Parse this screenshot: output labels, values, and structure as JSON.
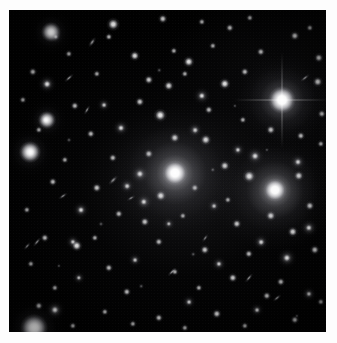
{
  "image": {
    "kind": "astronomical-photograph",
    "subject": "galaxy cluster field",
    "alt_text": "Deep optical image of a rich galaxy cluster: a black sky field densely populated with hundreds of point-like stars and fuzzy elliptical galaxies, dominated by two large diffuse central galaxies and one very bright foreground star near the upper right.",
    "width_px": 337,
    "height_px": 343,
    "plate": {
      "left_px": 9,
      "top_px": 10,
      "width_px": 317,
      "height_px": 322,
      "background_color": "#010101"
    },
    "border": {
      "color": "#fdfdfd",
      "top_px": 10,
      "left_px": 9,
      "right_px": 11,
      "bottom_px": 11
    },
    "palette": {
      "sky": "#010101",
      "faint_glow": "#16161a",
      "star_core": "#ffffff",
      "galaxy_halo": "#c4c4ca",
      "page": "#fdfdfd"
    }
  },
  "chart_data": {
    "type": "scatter",
    "title": "",
    "xlabel": "",
    "ylabel": "",
    "xlim": [
      0,
      317
    ],
    "ylim": [
      0,
      322
    ],
    "grid": false,
    "legend": "none",
    "note": "Positions are plate pixel coordinates relative to the dark field; size is apparent diameter in px; brightness is relative 0-1.",
    "dominant_objects": [
      {
        "name": "central-cd-galaxy",
        "x": 166,
        "y": 163,
        "size": 13,
        "halo": 66,
        "brightness": 1.0,
        "class": "cD elliptical"
      },
      {
        "name": "second-cd-galaxy",
        "x": 266,
        "y": 180,
        "size": 12,
        "halo": 60,
        "brightness": 0.97,
        "class": "cD elliptical"
      },
      {
        "name": "bright-foreground-star",
        "x": 273,
        "y": 90,
        "size": 14,
        "halo": 46,
        "brightness": 1.0,
        "class": "star with diffraction spikes"
      },
      {
        "name": "bottom-left-galaxy",
        "x": 25,
        "y": 318,
        "size": 14,
        "halo": 30,
        "brightness": 0.85,
        "class": "elliptical"
      },
      {
        "name": "left-mid-galaxy",
        "x": 21,
        "y": 142,
        "size": 11,
        "halo": 24,
        "brightness": 0.8,
        "class": "elliptical"
      },
      {
        "name": "upper-left-galaxy",
        "x": 42,
        "y": 22,
        "size": 10,
        "halo": 22,
        "brightness": 0.78,
        "class": "elliptical"
      },
      {
        "name": "left-galaxy-pair",
        "x": 38,
        "y": 110,
        "size": 9,
        "halo": 20,
        "brightness": 0.72,
        "class": "elliptical"
      }
    ],
    "galaxies": [
      {
        "x": 42,
        "y": 22,
        "r": 5.0,
        "b": 0.9,
        "t": "gal"
      },
      {
        "x": 47,
        "y": 27,
        "r": 3.2,
        "b": 0.62,
        "t": "gal"
      },
      {
        "x": 38,
        "y": 74,
        "r": 4.4,
        "b": 0.84,
        "t": "gal"
      },
      {
        "x": 21,
        "y": 142,
        "r": 5.4,
        "b": 0.88,
        "t": "gal"
      },
      {
        "x": 37,
        "y": 110,
        "r": 4.6,
        "b": 0.8,
        "t": "gal"
      },
      {
        "x": 25,
        "y": 318,
        "r": 6.6,
        "b": 0.86,
        "t": "gal"
      },
      {
        "x": 46,
        "y": 300,
        "r": 4.6,
        "b": 0.78,
        "t": "gal"
      },
      {
        "x": 72,
        "y": 200,
        "r": 4.0,
        "b": 0.74,
        "t": "gal"
      },
      {
        "x": 64,
        "y": 232,
        "r": 3.6,
        "b": 0.66,
        "t": "gal"
      },
      {
        "x": 118,
        "y": 176,
        "r": 3.8,
        "b": 0.7,
        "t": "gal"
      },
      {
        "x": 131,
        "y": 164,
        "r": 4.6,
        "b": 0.8,
        "t": "gal"
      },
      {
        "x": 135,
        "y": 192,
        "r": 4.2,
        "b": 0.76,
        "t": "gal"
      },
      {
        "x": 112,
        "y": 118,
        "r": 4.0,
        "b": 0.74,
        "t": "gal"
      },
      {
        "x": 95,
        "y": 95,
        "r": 3.4,
        "b": 0.64,
        "t": "gal"
      },
      {
        "x": 186,
        "y": 120,
        "r": 3.8,
        "b": 0.7,
        "t": "gal"
      },
      {
        "x": 193,
        "y": 86,
        "r": 4.2,
        "b": 0.76,
        "t": "gal"
      },
      {
        "x": 229,
        "y": 140,
        "r": 3.6,
        "b": 0.68,
        "t": "gal"
      },
      {
        "x": 246,
        "y": 146,
        "r": 4.4,
        "b": 0.8,
        "t": "gal"
      },
      {
        "x": 289,
        "y": 152,
        "r": 4.0,
        "b": 0.74,
        "t": "gal"
      },
      {
        "x": 300,
        "y": 218,
        "r": 4.2,
        "b": 0.76,
        "t": "gal"
      },
      {
        "x": 278,
        "y": 248,
        "r": 4.6,
        "b": 0.8,
        "t": "gal"
      },
      {
        "x": 252,
        "y": 232,
        "r": 3.8,
        "b": 0.7,
        "t": "gal"
      },
      {
        "x": 210,
        "y": 254,
        "r": 3.6,
        "b": 0.66,
        "t": "gal"
      },
      {
        "x": 180,
        "y": 292,
        "r": 3.4,
        "b": 0.62,
        "t": "gal"
      },
      {
        "x": 248,
        "y": 300,
        "r": 3.4,
        "b": 0.62,
        "t": "gal"
      },
      {
        "x": 300,
        "y": 284,
        "r": 3.6,
        "b": 0.66,
        "t": "gal"
      },
      {
        "x": 70,
        "y": 268,
        "r": 3.2,
        "b": 0.58,
        "t": "gal"
      },
      {
        "x": 126,
        "y": 250,
        "r": 3.4,
        "b": 0.62,
        "t": "gal"
      },
      {
        "x": 160,
        "y": 214,
        "r": 3.2,
        "b": 0.6,
        "t": "gal"
      },
      {
        "x": 205,
        "y": 196,
        "r": 3.4,
        "b": 0.62,
        "t": "gal"
      }
    ],
    "stars": [
      {
        "x": 104,
        "y": 14,
        "r": 2.6,
        "b": 0.95
      },
      {
        "x": 100,
        "y": 27,
        "r": 1.6,
        "b": 0.7
      },
      {
        "x": 154,
        "y": 9,
        "r": 2.0,
        "b": 0.8
      },
      {
        "x": 193,
        "y": 12,
        "r": 1.6,
        "b": 0.66
      },
      {
        "x": 221,
        "y": 18,
        "r": 1.8,
        "b": 0.72
      },
      {
        "x": 241,
        "y": 8,
        "r": 1.6,
        "b": 0.64
      },
      {
        "x": 286,
        "y": 26,
        "r": 2.0,
        "b": 0.78
      },
      {
        "x": 301,
        "y": 18,
        "r": 1.6,
        "b": 0.64
      },
      {
        "x": 60,
        "y": 44,
        "r": 1.6,
        "b": 0.62
      },
      {
        "x": 126,
        "y": 46,
        "r": 2.2,
        "b": 0.84
      },
      {
        "x": 165,
        "y": 41,
        "r": 1.6,
        "b": 0.64
      },
      {
        "x": 180,
        "y": 52,
        "r": 2.4,
        "b": 0.88
      },
      {
        "x": 204,
        "y": 36,
        "r": 1.6,
        "b": 0.62
      },
      {
        "x": 252,
        "y": 42,
        "r": 1.8,
        "b": 0.7
      },
      {
        "x": 310,
        "y": 48,
        "r": 2.0,
        "b": 0.76
      },
      {
        "x": 24,
        "y": 62,
        "r": 1.8,
        "b": 0.7
      },
      {
        "x": 88,
        "y": 64,
        "r": 1.6,
        "b": 0.62
      },
      {
        "x": 140,
        "y": 70,
        "r": 2.0,
        "b": 0.78
      },
      {
        "x": 160,
        "y": 76,
        "r": 2.2,
        "b": 0.82
      },
      {
        "x": 176,
        "y": 64,
        "r": 1.6,
        "b": 0.64
      },
      {
        "x": 216,
        "y": 74,
        "r": 2.4,
        "b": 0.88
      },
      {
        "x": 236,
        "y": 62,
        "r": 1.8,
        "b": 0.7
      },
      {
        "x": 309,
        "y": 72,
        "r": 2.2,
        "b": 0.82
      },
      {
        "x": 14,
        "y": 90,
        "r": 1.6,
        "b": 0.62
      },
      {
        "x": 66,
        "y": 96,
        "r": 1.8,
        "b": 0.7
      },
      {
        "x": 131,
        "y": 92,
        "r": 2.0,
        "b": 0.76
      },
      {
        "x": 151,
        "y": 105,
        "r": 2.6,
        "b": 0.92
      },
      {
        "x": 200,
        "y": 100,
        "r": 1.8,
        "b": 0.7
      },
      {
        "x": 234,
        "y": 110,
        "r": 1.6,
        "b": 0.64
      },
      {
        "x": 313,
        "y": 104,
        "r": 1.8,
        "b": 0.7
      },
      {
        "x": 30,
        "y": 120,
        "r": 1.6,
        "b": 0.62
      },
      {
        "x": 82,
        "y": 124,
        "r": 1.8,
        "b": 0.7
      },
      {
        "x": 166,
        "y": 128,
        "r": 2.2,
        "b": 0.82
      },
      {
        "x": 197,
        "y": 130,
        "r": 2.4,
        "b": 0.86
      },
      {
        "x": 262,
        "y": 120,
        "r": 2.0,
        "b": 0.76
      },
      {
        "x": 292,
        "y": 126,
        "r": 1.8,
        "b": 0.7
      },
      {
        "x": 312,
        "y": 134,
        "r": 1.6,
        "b": 0.64
      },
      {
        "x": 56,
        "y": 150,
        "r": 1.6,
        "b": 0.62
      },
      {
        "x": 104,
        "y": 148,
        "r": 1.8,
        "b": 0.7
      },
      {
        "x": 140,
        "y": 144,
        "r": 2.0,
        "b": 0.76
      },
      {
        "x": 216,
        "y": 156,
        "r": 2.2,
        "b": 0.82
      },
      {
        "x": 240,
        "y": 166,
        "r": 2.6,
        "b": 0.92
      },
      {
        "x": 290,
        "y": 166,
        "r": 2.2,
        "b": 0.82
      },
      {
        "x": 44,
        "y": 172,
        "r": 1.8,
        "b": 0.7
      },
      {
        "x": 88,
        "y": 178,
        "r": 2.0,
        "b": 0.76
      },
      {
        "x": 152,
        "y": 186,
        "r": 2.4,
        "b": 0.88
      },
      {
        "x": 186,
        "y": 178,
        "r": 1.8,
        "b": 0.7
      },
      {
        "x": 219,
        "y": 190,
        "r": 1.6,
        "b": 0.64
      },
      {
        "x": 262,
        "y": 206,
        "r": 2.2,
        "b": 0.82
      },
      {
        "x": 301,
        "y": 196,
        "r": 2.0,
        "b": 0.76
      },
      {
        "x": 18,
        "y": 200,
        "r": 1.6,
        "b": 0.62
      },
      {
        "x": 110,
        "y": 204,
        "r": 1.8,
        "b": 0.7
      },
      {
        "x": 136,
        "y": 212,
        "r": 2.0,
        "b": 0.76
      },
      {
        "x": 174,
        "y": 206,
        "r": 1.6,
        "b": 0.64
      },
      {
        "x": 228,
        "y": 214,
        "r": 2.0,
        "b": 0.78
      },
      {
        "x": 284,
        "y": 222,
        "r": 2.2,
        "b": 0.82
      },
      {
        "x": 36,
        "y": 228,
        "r": 1.8,
        "b": 0.7
      },
      {
        "x": 68,
        "y": 236,
        "r": 2.4,
        "b": 0.86
      },
      {
        "x": 86,
        "y": 228,
        "r": 1.6,
        "b": 0.64
      },
      {
        "x": 150,
        "y": 232,
        "r": 1.8,
        "b": 0.7
      },
      {
        "x": 196,
        "y": 240,
        "r": 2.0,
        "b": 0.76
      },
      {
        "x": 240,
        "y": 244,
        "r": 1.8,
        "b": 0.7
      },
      {
        "x": 306,
        "y": 240,
        "r": 2.0,
        "b": 0.76
      },
      {
        "x": 22,
        "y": 254,
        "r": 1.6,
        "b": 0.62
      },
      {
        "x": 100,
        "y": 258,
        "r": 1.8,
        "b": 0.7
      },
      {
        "x": 166,
        "y": 262,
        "r": 1.6,
        "b": 0.64
      },
      {
        "x": 224,
        "y": 268,
        "r": 2.0,
        "b": 0.76
      },
      {
        "x": 272,
        "y": 272,
        "r": 1.8,
        "b": 0.7
      },
      {
        "x": 46,
        "y": 278,
        "r": 1.6,
        "b": 0.62
      },
      {
        "x": 118,
        "y": 282,
        "r": 1.8,
        "b": 0.7
      },
      {
        "x": 190,
        "y": 278,
        "r": 1.6,
        "b": 0.64
      },
      {
        "x": 258,
        "y": 286,
        "r": 1.8,
        "b": 0.7
      },
      {
        "x": 312,
        "y": 292,
        "r": 1.6,
        "b": 0.62
      },
      {
        "x": 30,
        "y": 296,
        "r": 1.8,
        "b": 0.7
      },
      {
        "x": 96,
        "y": 302,
        "r": 1.6,
        "b": 0.64
      },
      {
        "x": 150,
        "y": 308,
        "r": 1.8,
        "b": 0.7
      },
      {
        "x": 208,
        "y": 304,
        "r": 2.0,
        "b": 0.76
      },
      {
        "x": 286,
        "y": 310,
        "r": 1.8,
        "b": 0.7
      },
      {
        "x": 64,
        "y": 316,
        "r": 1.6,
        "b": 0.62
      },
      {
        "x": 124,
        "y": 314,
        "r": 1.6,
        "b": 0.62
      },
      {
        "x": 176,
        "y": 318,
        "r": 1.6,
        "b": 0.6
      },
      {
        "x": 236,
        "y": 316,
        "r": 1.6,
        "b": 0.6
      }
    ],
    "streaks": [
      {
        "x": 83,
        "y": 32,
        "w": 12,
        "h": 4.5,
        "rot": -55,
        "b": 0.72
      },
      {
        "x": 60,
        "y": 68,
        "w": 12,
        "h": 4.0,
        "rot": -42,
        "b": 0.68
      },
      {
        "x": 78,
        "y": 100,
        "w": 11,
        "h": 4.0,
        "rot": -60,
        "b": 0.64
      },
      {
        "x": 54,
        "y": 186,
        "w": 11,
        "h": 4.0,
        "rot": -35,
        "b": 0.62
      },
      {
        "x": 104,
        "y": 170,
        "w": 13,
        "h": 4.5,
        "rot": -45,
        "b": 0.66
      },
      {
        "x": 28,
        "y": 232,
        "w": 12,
        "h": 4.0,
        "rot": -50,
        "b": 0.64
      },
      {
        "x": 18,
        "y": 236,
        "w": 10,
        "h": 3.6,
        "rot": -48,
        "b": 0.58
      },
      {
        "x": 163,
        "y": 262,
        "w": 12,
        "h": 4.2,
        "rot": -45,
        "b": 0.66
      },
      {
        "x": 240,
        "y": 268,
        "w": 12,
        "h": 4.2,
        "rot": -50,
        "b": 0.66
      },
      {
        "x": 268,
        "y": 288,
        "w": 11,
        "h": 4.0,
        "rot": -40,
        "b": 0.62
      },
      {
        "x": 122,
        "y": 188,
        "w": 10,
        "h": 3.8,
        "rot": -30,
        "b": 0.6
      },
      {
        "x": 196,
        "y": 228,
        "w": 10,
        "h": 3.6,
        "rot": -55,
        "b": 0.58
      },
      {
        "x": 296,
        "y": 68,
        "w": 12,
        "h": 4.2,
        "rot": -38,
        "b": 0.68
      }
    ],
    "faint_smudges": [
      {
        "x": 60,
        "y": 130,
        "r": 3.0,
        "b": 0.4
      },
      {
        "x": 150,
        "y": 60,
        "r": 2.8,
        "b": 0.36
      },
      {
        "x": 204,
        "y": 160,
        "r": 3.2,
        "b": 0.42
      },
      {
        "x": 226,
        "y": 96,
        "r": 2.6,
        "b": 0.34
      },
      {
        "x": 92,
        "y": 214,
        "r": 3.0,
        "b": 0.38
      },
      {
        "x": 184,
        "y": 244,
        "r": 2.8,
        "b": 0.36
      },
      {
        "x": 258,
        "y": 140,
        "r": 2.6,
        "b": 0.34
      },
      {
        "x": 132,
        "y": 276,
        "r": 2.8,
        "b": 0.36
      },
      {
        "x": 288,
        "y": 306,
        "r": 2.6,
        "b": 0.34
      },
      {
        "x": 50,
        "y": 256,
        "r": 2.6,
        "b": 0.32
      }
    ],
    "intracluster_glow": [
      {
        "x": 166,
        "y": 168,
        "rx": 70,
        "ry": 52,
        "b": 0.16
      },
      {
        "x": 266,
        "y": 186,
        "rx": 64,
        "ry": 56,
        "b": 0.15
      },
      {
        "x": 273,
        "y": 92,
        "rx": 44,
        "ry": 40,
        "b": 0.13
      }
    ]
  }
}
